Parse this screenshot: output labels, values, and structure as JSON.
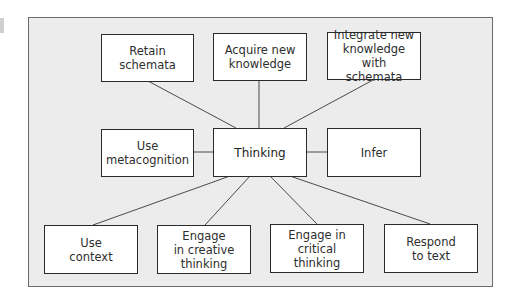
{
  "diagram": {
    "title": "",
    "type": "hub-and-spoke concept map",
    "colors": {
      "panel_background": "#ececec",
      "panel_border": "#6a6a6a",
      "node_background": "#ffffff",
      "node_border": "#2a2a2a",
      "connector": "#4a4a4a",
      "text": "#2e2e2e"
    },
    "center": {
      "id": "thinking",
      "label": "Thinking"
    },
    "nodes": [
      {
        "id": "retain_schemata",
        "label": "Retain\nschemata",
        "row": "top"
      },
      {
        "id": "acquire_knowledge",
        "label": "Acquire new\nknowledge",
        "row": "top"
      },
      {
        "id": "integrate_knowledge",
        "label": "Integrate new\nknowledge with\nschemata",
        "row": "top"
      },
      {
        "id": "use_metacognition",
        "label": "Use\nmetacognition",
        "row": "middle"
      },
      {
        "id": "infer",
        "label": "Infer",
        "row": "middle"
      },
      {
        "id": "use_context",
        "label": "Use\ncontext",
        "row": "bottom"
      },
      {
        "id": "engage_creative",
        "label": "Engage\nin creative\nthinking",
        "row": "bottom"
      },
      {
        "id": "engage_critical",
        "label": "Engage in\ncritical thinking",
        "row": "bottom"
      },
      {
        "id": "respond_to_text",
        "label": "Respond\nto text",
        "row": "bottom"
      }
    ],
    "edges": [
      {
        "from": "thinking",
        "to": "retain_schemata"
      },
      {
        "from": "thinking",
        "to": "acquire_knowledge"
      },
      {
        "from": "thinking",
        "to": "integrate_knowledge"
      },
      {
        "from": "thinking",
        "to": "use_metacognition"
      },
      {
        "from": "thinking",
        "to": "infer"
      },
      {
        "from": "thinking",
        "to": "use_context"
      },
      {
        "from": "thinking",
        "to": "engage_creative"
      },
      {
        "from": "thinking",
        "to": "engage_critical"
      },
      {
        "from": "thinking",
        "to": "respond_to_text"
      }
    ]
  }
}
